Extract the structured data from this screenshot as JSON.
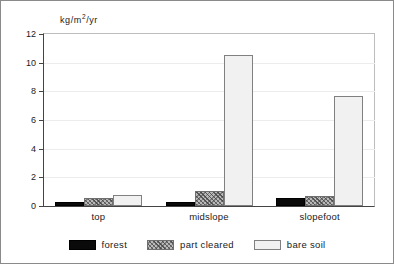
{
  "chart_data": {
    "type": "bar",
    "title": "",
    "subtitle": "",
    "xlabel": "",
    "ylabel": "kg/m2/yr",
    "ylabel_parts": {
      "pre": "kg/m",
      "sup": "2",
      "post": "/yr"
    },
    "categories": [
      "top",
      "midslope",
      "slopefoot"
    ],
    "series": [
      {
        "name": "forest",
        "values": [
          0.3,
          0.3,
          0.55
        ],
        "color": "#0a0a0a",
        "pattern": "solid"
      },
      {
        "name": "part cleared",
        "values": [
          0.55,
          1.05,
          0.7
        ],
        "color": "#b9b9b9",
        "pattern": "hatched"
      },
      {
        "name": "bare soil",
        "values": [
          0.8,
          10.55,
          7.65
        ],
        "color": "#f1f1f1",
        "pattern": "plain"
      }
    ],
    "ylim": [
      0,
      12
    ],
    "yticks": [
      0,
      2,
      4,
      6,
      8,
      10,
      12
    ],
    "ytick_labels": [
      "0",
      "2",
      "4",
      "6",
      "8",
      "10",
      "12"
    ],
    "grid": true,
    "grid_axis": "y",
    "legend_position": "bottom-center"
  },
  "legend": {
    "items": [
      {
        "label": "forest"
      },
      {
        "label": "part cleared"
      },
      {
        "label": "bare soil"
      }
    ]
  }
}
